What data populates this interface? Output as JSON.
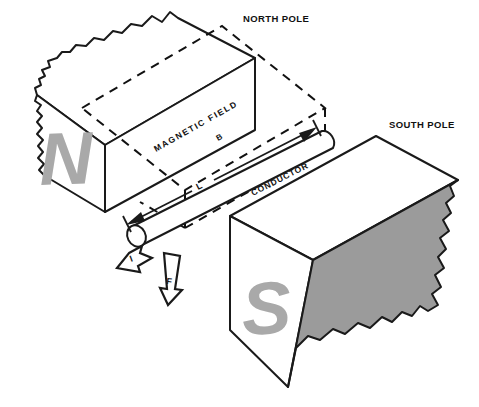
{
  "diagram": {
    "labels": {
      "north_pole": "NORTH POLE",
      "south_pole": "SOUTH POLE",
      "magnetic_field": "MAGNETIC FIELD",
      "magnetic_field_symbol": "B",
      "conductor": "CONDUCTOR",
      "length_symbol": "L",
      "current_symbol": "I",
      "force_symbol": "F",
      "north_letter": "N",
      "south_letter": "S"
    },
    "colors": {
      "background": "#ffffff",
      "outline": "#1a1a1a",
      "pole_letter_gray": "#a9a9a9",
      "shaded_face_gray": "#9b9b9b",
      "dashed_line": "#111111"
    },
    "elements": {
      "north_magnet": "north-pole-magnet-block",
      "south_magnet": "south-pole-magnet-block",
      "conductor_rod": "conductor-rod",
      "field_region": "magnetic-field-dashed-region",
      "current_arrow": "current-direction-arrow",
      "force_arrow": "force-direction-arrow",
      "length_dimension": "conductor-length-dimension"
    }
  }
}
